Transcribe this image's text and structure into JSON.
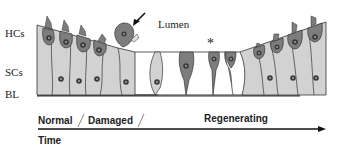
{
  "labels": {
    "hcs": "HCs",
    "scs": "SCs",
    "bl": "BL",
    "lumen": "Lumen",
    "asterisk": "*"
  },
  "timeline": {
    "stages": [
      "Normal",
      "Damaged",
      "Regenerating"
    ],
    "axis_label": "Time"
  },
  "colors": {
    "hair_cell": "#7d7d7d",
    "support_cell": "#d2d2d2",
    "nucleus": "#3a3a3a",
    "outline": "#333333",
    "background": "#ffffff"
  }
}
